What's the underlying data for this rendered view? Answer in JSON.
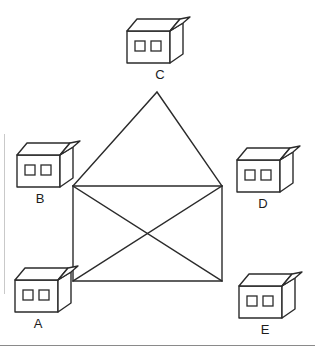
{
  "figure": {
    "width": 315,
    "height": 359,
    "background_color": "#ffffff",
    "stroke_color": "#2b2b2b",
    "frame_color": "#8a8a8a"
  },
  "houses": [
    {
      "id": "house-a",
      "label": "A",
      "position": "bottom-left",
      "x": 12,
      "y": 266,
      "label_x": 26,
      "label_y": 317,
      "windows": 2
    },
    {
      "id": "house-b",
      "label": "B",
      "position": "middle-left",
      "x": 14,
      "y": 141,
      "label_x": 28,
      "label_y": 192,
      "windows": 2
    },
    {
      "id": "house-c",
      "label": "C",
      "position": "top-center",
      "x": 124,
      "y": 17,
      "label_x": 148,
      "label_y": 68,
      "windows": 2
    },
    {
      "id": "house-d",
      "label": "D",
      "position": "middle-right",
      "x": 234,
      "y": 146,
      "label_x": 251,
      "label_y": 197,
      "windows": 2
    },
    {
      "id": "house-e",
      "label": "E",
      "position": "bottom-right",
      "x": 236,
      "y": 272,
      "label_x": 253,
      "label_y": 323,
      "windows": 2
    }
  ],
  "envelope": {
    "description": "Rectangle with crossing diagonals topped by a triangular flap",
    "vertices": {
      "apex": [
        157,
        92
      ],
      "top_left": [
        73,
        186
      ],
      "top_right": [
        222,
        186
      ],
      "bottom_left": [
        73,
        281
      ],
      "bottom_right": [
        222,
        281
      ]
    },
    "edges": [
      [
        "top_left",
        "apex"
      ],
      [
        "apex",
        "top_right"
      ],
      [
        "top_left",
        "top_right"
      ],
      [
        "top_left",
        "bottom_left"
      ],
      [
        "top_right",
        "bottom_right"
      ],
      [
        "bottom_left",
        "bottom_right"
      ],
      [
        "top_left",
        "bottom_right"
      ],
      [
        "top_right",
        "bottom_left"
      ]
    ],
    "stroke_width": 1.4
  }
}
